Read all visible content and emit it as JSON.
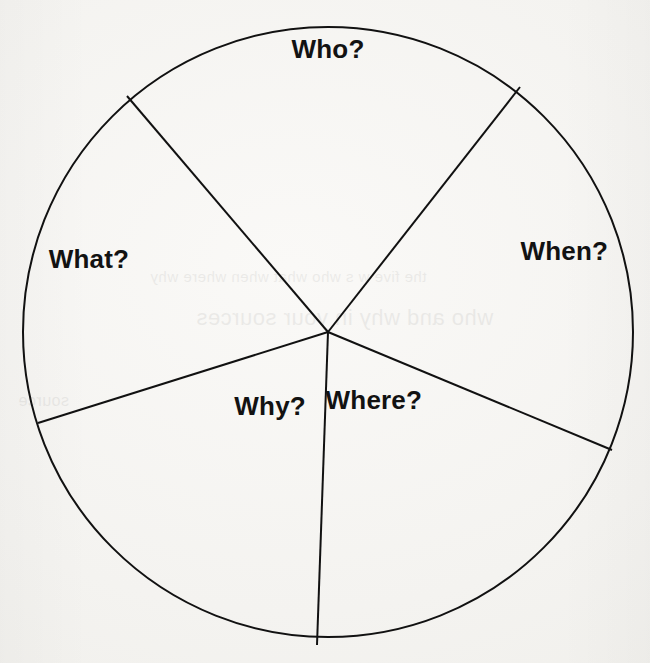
{
  "page": {
    "background_color": "#f6f5f3",
    "ink_color": "#121212"
  },
  "diagram": {
    "type": "circle-divided-into-sectors",
    "center": {
      "x": 328,
      "y": 332
    },
    "radius": 305,
    "stroke_color": "#111111",
    "stroke_width": 2,
    "fill": "none",
    "sector_count": 5
  },
  "labels": {
    "who": "Who?",
    "what": "What?",
    "when": "When?",
    "why": "Why?",
    "where": "Where?"
  },
  "bleed_through": {
    "line_1": "the five w s who what when where why",
    "line_2": "who and why in your sources",
    "line_3": "source"
  },
  "chart_data": {
    "type": "pie",
    "categories": [
      "Who?",
      "When?",
      "Where?",
      "Why?",
      "What?"
    ],
    "values": [
      78,
      72,
      72,
      71,
      67
    ],
    "labels_inside": true,
    "legend": "none",
    "grid": false,
    "fill": "none",
    "stroke": "#111111",
    "start_angle_deg": 52,
    "sectors": [
      {
        "name": "Who?",
        "start_deg": 52,
        "end_deg": 130,
        "sweep_deg": 78,
        "label_radius_px": 283,
        "label_angle_deg": 90
      },
      {
        "name": "What?",
        "start_deg": 130,
        "end_deg": 197,
        "sweep_deg": 67,
        "label_radius_px": 250,
        "label_angle_deg": 163
      },
      {
        "name": "Why?",
        "start_deg": 197,
        "end_deg": 268,
        "sweep_deg": 71,
        "label_radius_px": 94,
        "label_angle_deg": 232
      },
      {
        "name": "Where?",
        "start_deg": 268,
        "end_deg": 340,
        "sweep_deg": 72,
        "label_radius_px": 82,
        "label_angle_deg": 304
      },
      {
        "name": "When?",
        "start_deg": 340,
        "end_deg": 412,
        "sweep_deg": 72,
        "label_radius_px": 250,
        "label_angle_deg": 19
      }
    ],
    "spoke_endpoints": [
      {
        "name": "spoke-upper-left",
        "x": 127,
        "y": 96,
        "angle_deg": 130
      },
      {
        "name": "spoke-upper-right",
        "x": 520,
        "y": 87,
        "angle_deg": 52
      },
      {
        "name": "spoke-left",
        "x": 38,
        "y": 423,
        "angle_deg": 197
      },
      {
        "name": "spoke-right",
        "x": 612,
        "y": 450,
        "angle_deg": 340
      },
      {
        "name": "spoke-bottom",
        "x": 317,
        "y": 645,
        "angle_deg": 268
      }
    ]
  }
}
